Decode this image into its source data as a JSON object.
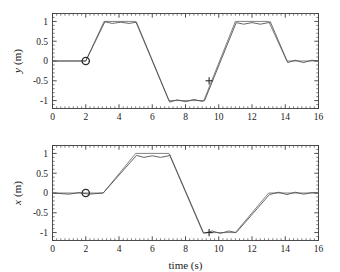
{
  "figure": {
    "panels": [
      {
        "id": "panel-y",
        "ylabel": "y (m)",
        "ylabel_symbol": "y",
        "ylabel_unit": "(m)",
        "xlabel": "",
        "yticks": [
          1,
          0.5,
          0,
          -0.5,
          -1
        ],
        "ytick_labels": [
          "1",
          "0.5",
          "0",
          "-0.5",
          "-1"
        ],
        "xticks": [
          0,
          2,
          4,
          6,
          8,
          10,
          12,
          14,
          16
        ],
        "xtick_labels": [
          "0",
          "2",
          "4",
          "6",
          "8",
          "10",
          "12",
          "14",
          "16"
        ],
        "show_xtick_labels": true
      },
      {
        "id": "panel-x",
        "ylabel": "x (m)",
        "ylabel_symbol": "x",
        "ylabel_unit": "(m)",
        "xlabel": "time (s)",
        "yticks": [
          1,
          0.5,
          0,
          -0.5,
          -1
        ],
        "ytick_labels": [
          "1",
          "0.5",
          "0",
          "-0.5",
          "-1"
        ],
        "xticks": [
          0,
          2,
          4,
          6,
          8,
          10,
          12,
          14,
          16
        ],
        "xtick_labels": [
          "0",
          "2",
          "4",
          "6",
          "8",
          "10",
          "12",
          "14",
          "16"
        ],
        "show_xtick_labels": true
      }
    ],
    "colors": {
      "reference": "#6e6e6e",
      "actual": "#4a4a4a",
      "axis": "#3c3c3c",
      "marker": "#2b2b2b",
      "background": "#ffffff"
    }
  },
  "chart_data": [
    {
      "type": "line",
      "id": "y-vs-time",
      "title": "",
      "xlabel": "",
      "ylabel": "y (m)",
      "xlim": [
        0,
        16
      ],
      "ylim": [
        -1.2,
        1.2
      ],
      "xticks": [
        0,
        2,
        4,
        6,
        8,
        10,
        12,
        14,
        16
      ],
      "yticks": [
        -1,
        -0.5,
        0,
        0.5,
        1
      ],
      "grid": false,
      "legend": "none",
      "series": [
        {
          "name": "reference",
          "style": "trapezoidal piecewise-linear",
          "x": [
            0,
            2,
            3.1,
            5.0,
            7.0,
            9.1,
            11.0,
            13.0,
            14.1,
            16
          ],
          "y": [
            0,
            0,
            1,
            1,
            -1,
            -1,
            1,
            1,
            0,
            0
          ]
        },
        {
          "name": "actual",
          "style": "tracked with small ripple on plateaus",
          "x": [
            0,
            2,
            3.15,
            3.6,
            4.1,
            4.6,
            5.05,
            7.05,
            7.5,
            8.0,
            8.5,
            9.0,
            9.15,
            11.05,
            11.5,
            12.0,
            12.5,
            13.0,
            13.1,
            14.15,
            14.6,
            15.1,
            15.6,
            16
          ],
          "y": [
            0,
            0,
            0.99,
            0.95,
            0.98,
            0.95,
            0.98,
            -1.04,
            -0.98,
            -1.03,
            -0.97,
            -1.02,
            -1.0,
            0.97,
            0.93,
            0.97,
            0.93,
            0.97,
            0.99,
            -0.04,
            0.02,
            -0.04,
            0.02,
            0.0
          ]
        }
      ],
      "markers": [
        {
          "name": "start-marker",
          "symbol": "circle",
          "x": 2.0,
          "y": 0.0
        },
        {
          "name": "event-marker",
          "symbol": "plus",
          "x": 9.42,
          "y": -0.5
        }
      ]
    },
    {
      "type": "line",
      "id": "x-vs-time",
      "title": "",
      "xlabel": "time (s)",
      "ylabel": "x (m)",
      "xlim": [
        0,
        16
      ],
      "ylim": [
        -1.2,
        1.2
      ],
      "xticks": [
        0,
        2,
        4,
        6,
        8,
        10,
        12,
        14,
        16
      ],
      "yticks": [
        -1,
        -0.5,
        0,
        0.5,
        1
      ],
      "grid": false,
      "legend": "none",
      "series": [
        {
          "name": "reference",
          "style": "trapezoidal piecewise-linear",
          "x": [
            0,
            3.05,
            5.0,
            7.0,
            9.05,
            11.0,
            13.0,
            16
          ],
          "y": [
            0,
            0,
            1,
            1,
            -1,
            -1,
            0,
            0
          ]
        },
        {
          "name": "actual",
          "style": "tracked with small ripple on plateaus",
          "x": [
            0,
            1.0,
            1.6,
            2.2,
            3.05,
            5.05,
            5.5,
            6.0,
            6.5,
            7.0,
            7.05,
            9.1,
            9.6,
            10.1,
            10.6,
            11.05,
            13.05,
            13.6,
            14.1,
            14.6,
            15.1,
            15.6,
            16
          ],
          "y": [
            0,
            -0.03,
            0.01,
            -0.03,
            0.0,
            0.95,
            0.9,
            0.94,
            0.9,
            0.94,
            0.97,
            -1.02,
            -0.96,
            -1.02,
            -0.96,
            -1.0,
            -0.04,
            0.02,
            -0.04,
            0.02,
            -0.03,
            0.01,
            0.0
          ]
        }
      ],
      "markers": [
        {
          "name": "start-marker",
          "symbol": "circle",
          "x": 2.0,
          "y": 0.0
        },
        {
          "name": "event-marker",
          "symbol": "plus",
          "x": 9.42,
          "y": -1.0
        }
      ]
    }
  ]
}
